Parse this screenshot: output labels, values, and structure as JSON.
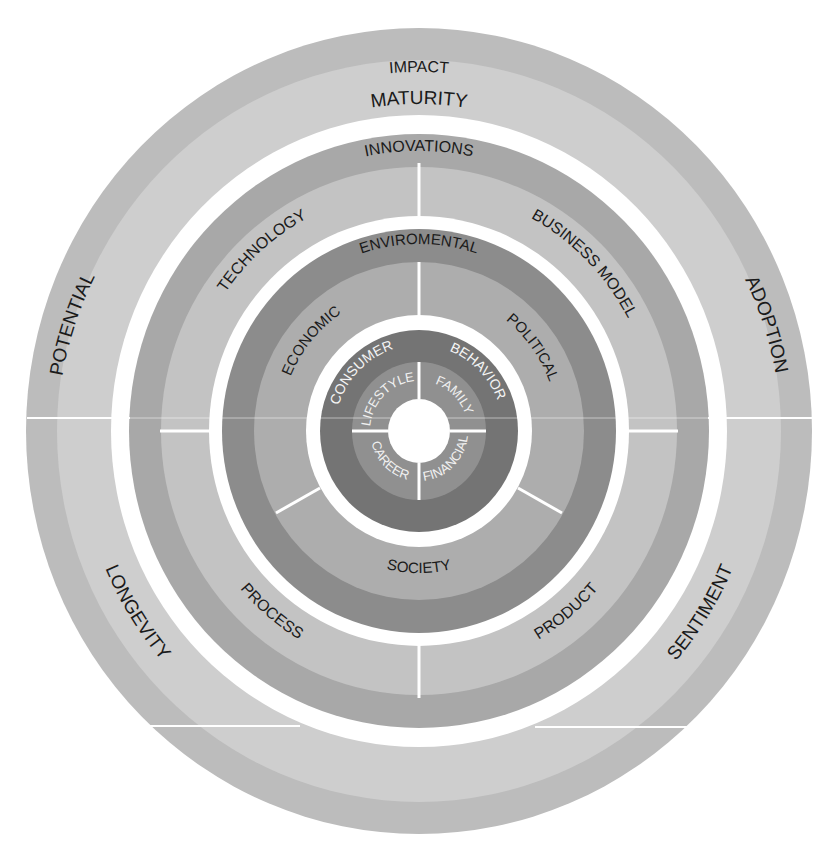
{
  "diagram": {
    "colors": {
      "background": "#ffffff",
      "outer_band": "#bcbcbc",
      "outer_inner_band": "#cecece",
      "tech_band": "#a8a8a8",
      "tech_inner": "#c3c3c3",
      "env_band": "#8c8c8c",
      "env_inner": "#adadad",
      "consumer_band": "#747474",
      "lifestyle_ring": "#909090",
      "gap": "#ffffff",
      "divider": "#ffffff",
      "text_dark": "#1a1a1a",
      "text_light": "#f2f2f2"
    },
    "rings": [
      {
        "level": 1,
        "name": "outer",
        "band_label": "IMPACT",
        "labels": [
          "MATURITY",
          "POTENTIAL",
          "ADOPTION",
          "LONGEVITY",
          "SENTIMENT"
        ]
      },
      {
        "level": 2,
        "name": "innovation",
        "band_label": "INNOVATIONS",
        "labels": [
          "TECHNOLOGY",
          "BUSINESS MODEL",
          "PROCESS",
          "PRODUCT"
        ]
      },
      {
        "level": 3,
        "name": "environment",
        "band_label": "ENVIROMENTAL",
        "labels": [
          "ECONOMIC",
          "POLITICAL",
          "SOCIETY"
        ]
      },
      {
        "level": 4,
        "name": "consumer",
        "labels": [
          "CONSUMER",
          "BEHAVIOR"
        ]
      },
      {
        "level": 5,
        "name": "core",
        "labels": [
          "LIFESTYLE",
          "FAMILY",
          "CAREER",
          "FINANCIAL"
        ]
      }
    ]
  },
  "labels": {
    "impact": "IMPACT",
    "maturity": "MATURITY",
    "potential": "POTENTIAL",
    "adoption": "ADOPTION",
    "longevity": "LONGEVITY",
    "sentiment": "SENTIMENT",
    "innovations": "INNOVATIONS",
    "technology": "TECHNOLOGY",
    "business_model": "BUSINESS MODEL",
    "process": "PROCESS",
    "product": "PRODUCT",
    "enviromental": "ENVIROMENTAL",
    "economic": "ECONOMIC",
    "political": "POLITICAL",
    "society": "SOCIETY",
    "consumer": "CONSUMER",
    "behavior": "BEHAVIOR",
    "lifestyle": "LIFESTYLE",
    "family": "FAMILY",
    "career": "CAREER",
    "financial": "FINANCIAL"
  }
}
